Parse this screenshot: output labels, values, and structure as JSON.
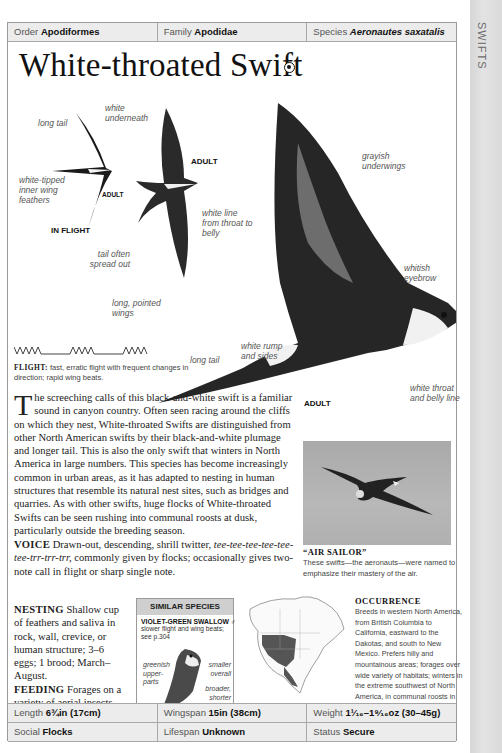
{
  "side_tab": {
    "label": "SWIFTS"
  },
  "header": {
    "order": {
      "key": "Order",
      "value": "Apodiformes"
    },
    "family": {
      "key": "Family",
      "value": "Apodidae"
    },
    "species": {
      "key": "Species",
      "value": "Aeronautes saxatalis"
    }
  },
  "title": "White-throated Swift",
  "audio_icon": "speaker-icon",
  "illustrations": {
    "in_flight": {
      "caption": "IN FLIGHT",
      "age": "ADULT",
      "labels": {
        "long_tail": "long tail",
        "white_underneath": "white underneath",
        "white_tipped": "white-tipped inner wing feathers"
      }
    },
    "adult_top": {
      "age": "ADULT",
      "labels": {
        "white_line": "white line from throat to belly",
        "tail_spread": "tail often spread out",
        "pointed_wings": "long, pointed wings"
      }
    },
    "adult_main": {
      "age": "ADULT",
      "labels": {
        "grayish_underwings": "grayish underwings",
        "whitish_eyebrow": "whitish eyebrow",
        "white_rump": "white rump and sides",
        "long_tail": "long tail",
        "white_throat": "white throat and belly line"
      }
    }
  },
  "flight": {
    "key": "FLIGHT:",
    "text": "fast, erratic flight with frequent changes in direction; rapid wing beats."
  },
  "description": {
    "dropcap": "T",
    "text": "he screeching calls of this black-and-white swift is a familiar sound in canyon country. Often seen racing around the cliffs on which they nest, White-throated Swifts are distinguished from other North American swifts by their black-and-white plumage and longer tail. This is also the only swift that winters in North America in large numbers. This species has become increasingly common in urban areas, as it has adapted to nesting in human structures that resemble its natural nest sites, such as bridges and quarries. As with other swifts, huge flocks of White-throated Swifts can be seen rushing into communal roosts at dusk, particularly outside the breeding season."
  },
  "voice": {
    "key": "VOICE",
    "text_before": "Drawn-out, descending, shrill twitter,",
    "call": "tee-tee-tee-tee-tee-tee-trr-trr-trr,",
    "text_after": "commonly given by flocks; occasionally gives two-note call in flight or sharp single note."
  },
  "nesting": {
    "key": "NESTING",
    "text": "Shallow cup of feathers and saliva in rock, wall, crevice, or human structure; 3–6 eggs; 1 brood; March–August."
  },
  "feeding": {
    "key": "FEEDING",
    "text": "Forages on a variety of aerial insects."
  },
  "photo_caption": {
    "title": "“AIR SAILOR”",
    "text": "These swifts—the aeronauts—were named to emphasize their mastery of the air."
  },
  "similar_species": {
    "heading": "SIMILAR SPECIES",
    "name": "VIOLET-GREEN SWALLOW ♂",
    "desc": "slower flight and wing beats; see p.304",
    "labels": {
      "greenish": "greenish upper-parts",
      "smaller": "smaller overall",
      "broader": "broader, shorter wings"
    }
  },
  "occurrence": {
    "title": "OCCURRENCE",
    "text": "Breeds in western North America, from British Columbia to California, eastward to the Dakotas, and south to New Mexico. Prefers hilly and mountainous areas; forages over wide variety of habitats; winters in the extreme southwest of North America, in communal roosts in canyons."
  },
  "stats": {
    "length": {
      "key": "Length",
      "value": "6¾in (17cm)"
    },
    "wingspan": {
      "key": "Wingspan",
      "value": "15in (38cm)"
    },
    "weight": {
      "key": "Weight",
      "value": "1¹⁄₁₆–1⁹⁄₁₆oz (30–45g)"
    },
    "social": {
      "key": "Social",
      "value": "Flocks"
    },
    "lifespan": {
      "key": "Lifespan",
      "value": "Unknown"
    },
    "status": {
      "key": "Status",
      "value": "Secure"
    }
  },
  "colors": {
    "header_bg": "#ececec",
    "border": "#a8a8a8",
    "side_tab": "#dadada",
    "range_map_fill": "#555555"
  }
}
